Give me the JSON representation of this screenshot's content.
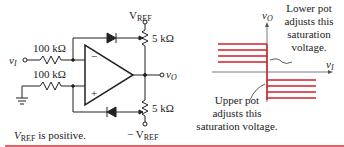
{
  "circuit": {
    "vref_top_label": "V",
    "vref_top_sub": "REF",
    "vref_bottom_label": "− V",
    "vref_bottom_sub": "REF",
    "input_label": "v",
    "input_sub": "I",
    "output_label": "v",
    "output_sub": "O",
    "resistor_input": "100 kΩ",
    "resistor_ground": "100 kΩ",
    "pot_upper": "5 kΩ",
    "pot_lower": "5 kΩ",
    "opamp_minus": "−",
    "opamp_plus": "+",
    "note_v": "V",
    "note_sub": "REF",
    "note_text": " is positive."
  },
  "transfer_plot": {
    "y_axis_label": "v",
    "y_axis_sub": "O",
    "x_axis_label": "v",
    "x_axis_sub": "I",
    "annotation_lower_pot": [
      "Lower pot",
      "adjusts this",
      "saturation",
      "voltage."
    ],
    "annotation_upper_pot": [
      "Upper pot",
      "adjusts this",
      "saturation voltage."
    ],
    "line_color": "#d0202a"
  },
  "footer_rule_color": "#d0303a"
}
